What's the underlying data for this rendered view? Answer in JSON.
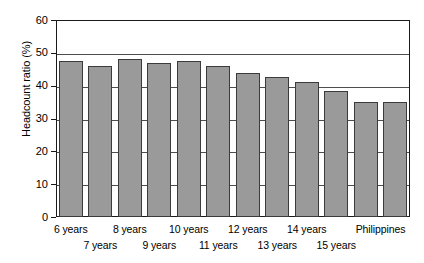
{
  "chart_data": {
    "type": "bar",
    "title": "",
    "subtitle": "",
    "xlabel": "",
    "ylabel": "Headcount ratio (%)",
    "categories": [
      "6 years",
      "7 years",
      "8 years",
      "9 years",
      "10 years",
      "11 years",
      "12 years",
      "13 years",
      "14 years",
      "15 years",
      "Philippines"
    ],
    "values": [
      47.5,
      46.0,
      48.0,
      47.0,
      47.5,
      46.0,
      44.0,
      42.5,
      41.0,
      38.5,
      35.0
    ],
    "bar_count_rendered": 12,
    "ylim": [
      0,
      60
    ],
    "yticks": [
      0,
      10,
      20,
      30,
      40,
      50,
      60
    ],
    "ytick_labels": [
      "0",
      "10",
      "20",
      "30",
      "40",
      "50",
      "60"
    ],
    "grid": "horizontal",
    "legend": "none",
    "bar_color": "#9a9a9a",
    "bar_edge_color": "#3b3b3b",
    "axis_color": "#1a1a1a"
  },
  "axis": {
    "y_title": "Headcount ratio (%)",
    "ticks": [
      {
        "label": "60",
        "value": 60
      },
      {
        "label": "50",
        "value": 50
      },
      {
        "label": "40",
        "value": 40
      },
      {
        "label": "30",
        "value": 30
      },
      {
        "label": "20",
        "value": 20
      },
      {
        "label": "10",
        "value": 10
      },
      {
        "label": "0",
        "value": 0
      }
    ]
  },
  "x_labels_top": [
    {
      "text": "6 years"
    },
    {
      "text": "8 years"
    },
    {
      "text": "10 years"
    },
    {
      "text": "12 years"
    },
    {
      "text": "14 years"
    },
    {
      "text": "Philippines"
    }
  ],
  "x_labels_bottom": [
    {
      "text": "7 years"
    },
    {
      "text": "9 years"
    },
    {
      "text": "11 years"
    },
    {
      "text": "13 years"
    },
    {
      "text": "15 years"
    }
  ],
  "bars": [
    {
      "label": "6 years",
      "value": 47.5
    },
    {
      "label": "7 years",
      "value": 46.0
    },
    {
      "label": "8 years",
      "value": 48.0
    },
    {
      "label": "9 years",
      "value": 47.0
    },
    {
      "label": "10 years",
      "value": 47.5
    },
    {
      "label": "11 years",
      "value": 46.0
    },
    {
      "label": "12 years",
      "value": 44.0
    },
    {
      "label": "13 years",
      "value": 42.5
    },
    {
      "label": "14 years",
      "value": 41.0
    },
    {
      "label": "15 years",
      "value": 38.5
    },
    {
      "label": "Philippines",
      "value": 35.0
    }
  ]
}
